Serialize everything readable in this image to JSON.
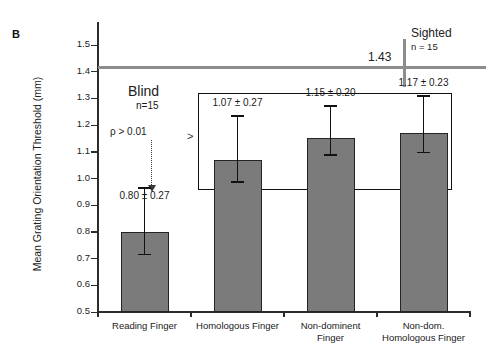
{
  "figure": {
    "panel_label": "B"
  },
  "chart_data": {
    "type": "bar",
    "title": "",
    "xlabel": "",
    "ylabel": "Mean Grating Orientation Threshold (mm)",
    "ylim": [
      0.5,
      1.5
    ],
    "ytick_labels": [
      "1.5",
      "1.4",
      "1.3",
      "1.2",
      "1.1",
      "1.0",
      "0.9",
      "0.8",
      "0.7",
      "0.6",
      "0.5"
    ],
    "ytick_values": [
      1.5,
      1.4,
      1.3,
      1.2,
      1.1,
      1.0,
      0.9,
      0.8,
      0.7,
      0.6,
      0.5
    ],
    "grid": false,
    "legend": "none",
    "categories": [
      "Reading Finger",
      "Homologous Finger",
      "Non-dominent\nFinger",
      "Non-dom.\nHomologous Finger"
    ],
    "values": [
      0.8,
      1.07,
      1.15,
      1.17
    ],
    "errors": [
      0.27,
      0.27,
      0.2,
      0.23
    ],
    "value_labels": [
      "0.80 ± 0.27",
      "1.07 ± 0.27",
      "1.15 ± 0.20",
      "1.17 ± 0.23"
    ],
    "bar_color": "#7b7b7b",
    "bar_edge_color": "#242424",
    "reference_line": {
      "value": 1.43,
      "label": "1.43",
      "color": "#8d8d8d",
      "group_name": "Sighted",
      "group_n": "n = 15"
    },
    "annotations": {
      "group_name": "Blind",
      "group_n": "n=15",
      "significance": "ρ > 0.01",
      "comparison_symbol": ">"
    }
  }
}
